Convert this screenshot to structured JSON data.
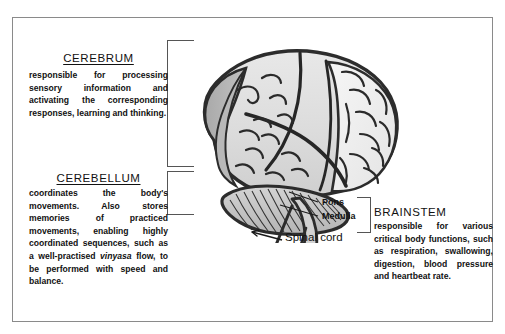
{
  "diagram": {
    "frame_color": "#8a8a8a",
    "illustration": {
      "name": "brain-illustration",
      "style": "hand-drawn grayscale sketch",
      "parts": [
        "cerebrum",
        "cerebellum",
        "pons",
        "medulla",
        "spinal cord"
      ]
    },
    "sections": [
      {
        "id": "cerebrum",
        "heading": "CEREBRUM",
        "underlined": true,
        "body": "responsible for processing sensory information and activating the corresponding responses, learning and thinking."
      },
      {
        "id": "cerebellum",
        "heading": "CEREBELLUM",
        "underlined": true,
        "body_part1": "coordinates the body's movements. Also stores memories of practiced movements, enabling highly coordinated sequences, such as a well-practised ",
        "body_italic": "vinyasa",
        "body_part2": " flow, to be performed with speed and balance."
      },
      {
        "id": "brainstem",
        "heading": "BRAINSTEM",
        "underlined": false,
        "body": "responsible for various critical body functions, such as respiration, swallowing, digestion, blood pressure and heartbeat rate."
      }
    ],
    "inner_labels": [
      {
        "id": "pons",
        "text": "Pons"
      },
      {
        "id": "medulla",
        "text": "Medulla"
      },
      {
        "id": "spinal_cord",
        "text": "Spinal cord"
      }
    ]
  }
}
